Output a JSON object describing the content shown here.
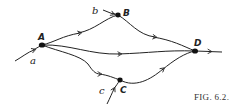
{
  "figure": {
    "caption": "FIG. 6.2.",
    "nodes": [
      {
        "id": "A",
        "label": "A",
        "x": 42,
        "y": 45
      },
      {
        "id": "B",
        "label": "B",
        "x": 118,
        "y": 15
      },
      {
        "id": "C",
        "label": "C",
        "x": 120,
        "y": 80
      },
      {
        "id": "D",
        "label": "D",
        "x": 195,
        "y": 51
      }
    ],
    "inputs": [
      {
        "label": "a",
        "to": "A"
      },
      {
        "label": "b",
        "to": "B"
      },
      {
        "label": "c",
        "to": "C"
      }
    ],
    "edges": [
      {
        "from": "A",
        "to": "B"
      },
      {
        "from": "A",
        "to": "D"
      },
      {
        "from": "A",
        "to": "C"
      },
      {
        "from": "B",
        "to": "D"
      },
      {
        "from": "C",
        "to": "D"
      }
    ],
    "output": {
      "from": "D"
    }
  }
}
